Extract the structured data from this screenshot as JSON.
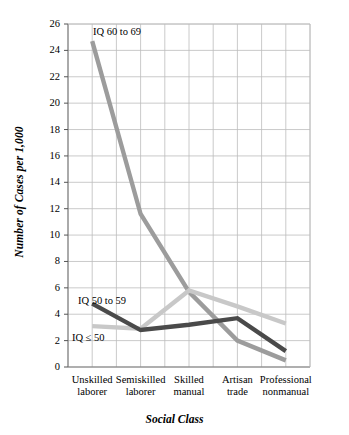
{
  "chart_data": {
    "type": "line",
    "title": "",
    "xlabel": "Social Class",
    "ylabel": "Number of Cases per 1,000",
    "categories": [
      "Unskilled laborer",
      "Semiskilled laborer",
      "Skilled manual",
      "Artisan trade",
      "Professional nonmanual"
    ],
    "category_lines": [
      [
        "Unskilled",
        "laborer"
      ],
      [
        "Semiskilled",
        "laborer"
      ],
      [
        "Skilled",
        "manual"
      ],
      [
        "Artisan",
        "trade"
      ],
      [
        "Professional",
        "nonmanual"
      ]
    ],
    "ylim": [
      0,
      26
    ],
    "yticks": [
      0,
      2,
      4,
      6,
      8,
      10,
      12,
      14,
      16,
      18,
      20,
      22,
      24,
      26
    ],
    "grid": true,
    "legend_position": "inline-labels",
    "series": [
      {
        "name": "IQ 60 to 69",
        "color": "#9c9c9c",
        "values": [
          24.7,
          11.6,
          5.7,
          2.0,
          0.5
        ],
        "label_x": 93,
        "label_y": 26
      },
      {
        "name": "IQ 50 to 59",
        "color": "#4a4a4a",
        "values": [
          4.8,
          2.8,
          3.2,
          3.7,
          1.2
        ],
        "label_x": 78,
        "label_y": 295
      },
      {
        "name": "IQ ≤ 50",
        "color": "#c8c8c8",
        "values": [
          3.1,
          2.9,
          5.8,
          4.6,
          3.3
        ],
        "label_x": 72,
        "label_y": 332
      }
    ]
  }
}
